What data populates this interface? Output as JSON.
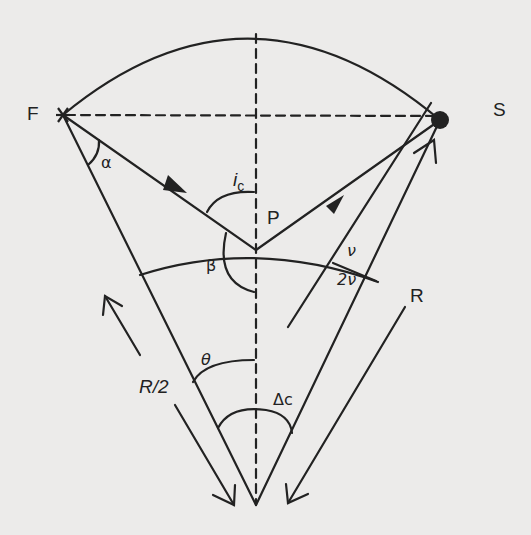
{
  "diagram": {
    "type": "geometry-construction",
    "colors": {
      "background": "#ecebea",
      "stroke": "#222222"
    },
    "points": {
      "F": {
        "label": "F",
        "marker": "asterisk"
      },
      "S": {
        "label": "S",
        "marker": "filled-dot"
      },
      "P": {
        "label": "P"
      }
    },
    "angle_labels": {
      "alpha": "α",
      "ic_main": "i",
      "ic_sub": "c",
      "beta": "β",
      "nu": "ν",
      "two_nu": "2ν",
      "theta": "θ",
      "delta_c": "Δc"
    },
    "length_labels": {
      "half_radius": "R/2",
      "radius": "R"
    }
  }
}
